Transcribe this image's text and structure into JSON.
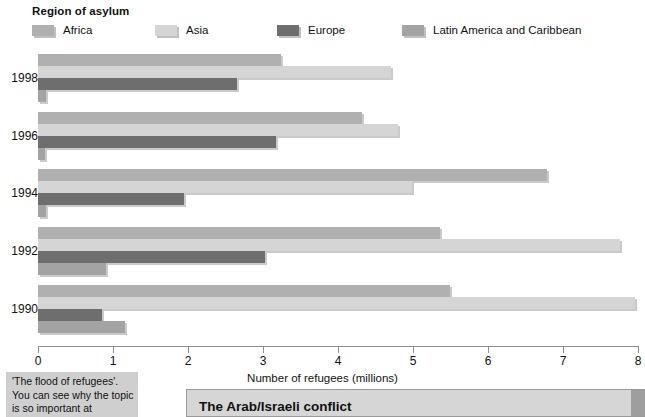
{
  "legend": {
    "title": "Region of asylum",
    "items": [
      {
        "label": "Africa",
        "color": "#b0b0b0",
        "key": "africa"
      },
      {
        "label": "Asia",
        "color": "#d5d5d5",
        "key": "asia"
      },
      {
        "label": "Europe",
        "color": "#6e6e6e",
        "key": "europe"
      },
      {
        "label": "Latin America and Caribbean",
        "color": "#a3a3a3",
        "key": "latin_america"
      }
    ]
  },
  "axis": {
    "title": "Number of refugees (millions)",
    "ticks": [
      "0",
      "1",
      "2",
      "3",
      "4",
      "5",
      "6",
      "7",
      "8"
    ],
    "min": 0,
    "max": 8
  },
  "caption": {
    "text": "'The flood of refugees'. You can see why the topic is so important at"
  },
  "panel": {
    "title": "The Arab/Israeli conflict"
  },
  "chart_data": {
    "type": "bar",
    "orientation": "horizontal",
    "title": "Region of asylum",
    "xlabel": "Number of refugees (millions)",
    "ylabel": "",
    "xlim": [
      0,
      8
    ],
    "grid": false,
    "legend_position": "top",
    "categories": [
      "1998",
      "1996",
      "1994",
      "1992",
      "1990"
    ],
    "series": [
      {
        "name": "Africa",
        "color": "#b0b0b0",
        "values": [
          3.24,
          4.32,
          6.79,
          5.36,
          5.49
        ]
      },
      {
        "name": "Asia",
        "color": "#d5d5d5",
        "values": [
          4.7,
          4.8,
          4.99,
          7.76,
          7.96
        ]
      },
      {
        "name": "Europe",
        "color": "#6e6e6e",
        "values": [
          2.65,
          3.17,
          1.95,
          3.03,
          0.85
        ]
      },
      {
        "name": "Latin America and Caribbean",
        "color": "#a3a3a3",
        "values": [
          0.1,
          0.09,
          0.11,
          0.91,
          1.16
        ]
      }
    ]
  }
}
